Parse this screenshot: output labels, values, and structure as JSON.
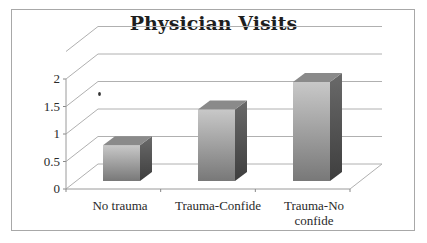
{
  "chart_data": {
    "type": "bar",
    "style": "3d-column",
    "title": "Physician Visits",
    "xlabel": "",
    "ylabel": "",
    "categories": [
      "No trauma",
      "Trauma-Confide",
      "Trauma-No confide"
    ],
    "category_label_lines": [
      [
        "No trauma"
      ],
      [
        "Trauma-Confide"
      ],
      [
        "Trauma-No",
        "confide"
      ]
    ],
    "values": [
      0.65,
      1.3,
      1.8
    ],
    "ylim": [
      0,
      2
    ],
    "yticks": [
      "0",
      "0.5",
      "1",
      "1.5",
      "2"
    ],
    "ytick_values": [
      0,
      0.5,
      1,
      1.5,
      2
    ],
    "grid": true,
    "legend": "none",
    "annotations": [
      {
        "type": "dot",
        "near": "y=1.6, left of first bar"
      }
    ]
  },
  "colors": {
    "bar_front_light": "#c4c4c4",
    "bar_front_dark": "#7a7a7a",
    "bar_top": "#8a8a8a",
    "bar_side": "#555555",
    "grid": "#b0b0b0",
    "border": "#a8a8a8"
  }
}
